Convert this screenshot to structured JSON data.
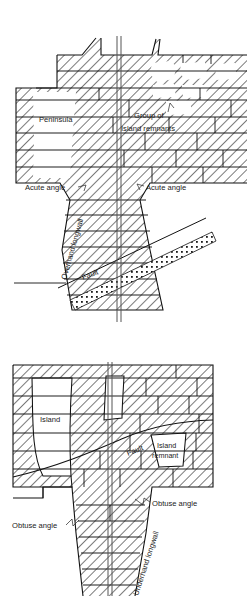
{
  "figure": {
    "background_color": "#ffffff",
    "ink_color": "#111111",
    "text_color": "#222222",
    "hatch_color": "#3a3a3a",
    "void_fill": "#ffffff",
    "width": 247,
    "height": 596
  },
  "upper_diagram": {
    "name": "overhand-longwall-plan",
    "labels": {
      "peninsula": "Peninsula",
      "group_of": "Group of",
      "island_remnants": "Island remnants",
      "acute_angle_left": "Acute angle",
      "acute_angle_right": "Acute angle",
      "overhand_longwall": "Overhand longwall",
      "fault": "Fault"
    },
    "rotations": {
      "overhand_longwall_deg": -74,
      "fault_deg": -21
    }
  },
  "lower_diagram": {
    "name": "underhand-longwall-plan",
    "labels": {
      "island": "Island",
      "fault": "Fault",
      "island_remnant_line1": "Island",
      "island_remnant_line2": "remnant",
      "obtuse_angle_left": "Obtuse angle",
      "obtuse_angle_right": "Obtuse angle",
      "underhand_longwall": "Underhand longwall"
    },
    "rotations": {
      "underhand_longwall_deg": 72,
      "fault_deg": -22
    }
  }
}
